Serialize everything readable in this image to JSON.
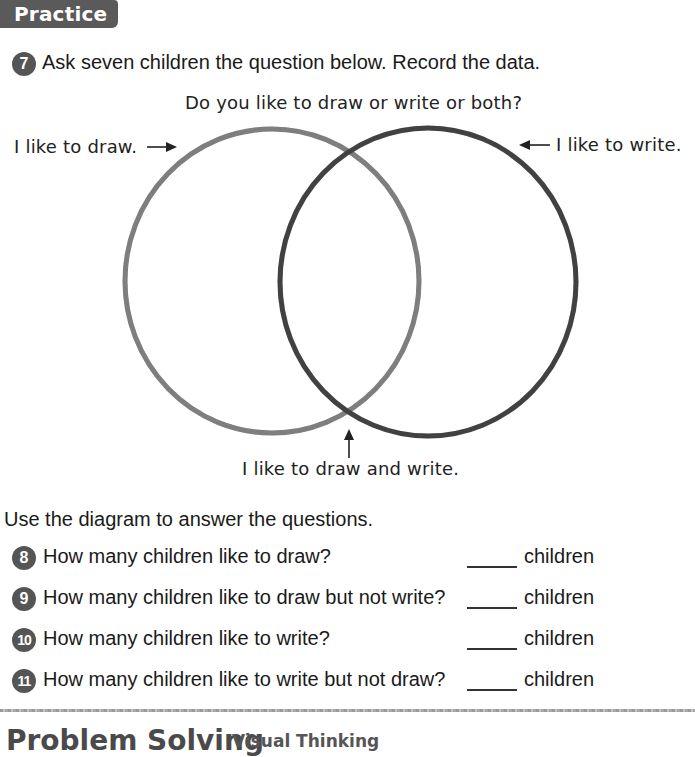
{
  "header": {
    "section_label": "Practice"
  },
  "exercise7": {
    "number": "7",
    "instruction": "Ask seven children the question below. Record the data."
  },
  "diagram": {
    "question": "Do you like to draw or write or both?",
    "label_left": "I like to draw.",
    "label_right": "I like to write.",
    "label_overlap": "I like to draw and write.",
    "left_circle_color": "#8a8a8a",
    "right_circle_color": "#4a4a4a"
  },
  "instructions": {
    "use_diagram": "Use the diagram to answer the questions."
  },
  "questions": [
    {
      "number": "8",
      "text": "How many children like to draw?",
      "answer": "",
      "unit": "children"
    },
    {
      "number": "9",
      "text": "How many children like to draw but not write?",
      "answer": "",
      "unit": "children"
    },
    {
      "number": "10",
      "text": "How many children like to write?",
      "answer": "",
      "unit": "children"
    },
    {
      "number": "11",
      "text": "How many children like to write but not draw?",
      "answer": "",
      "unit": "children"
    }
  ],
  "footer": {
    "title": "Problem Solving",
    "subtitle": "Visual Thinking"
  }
}
